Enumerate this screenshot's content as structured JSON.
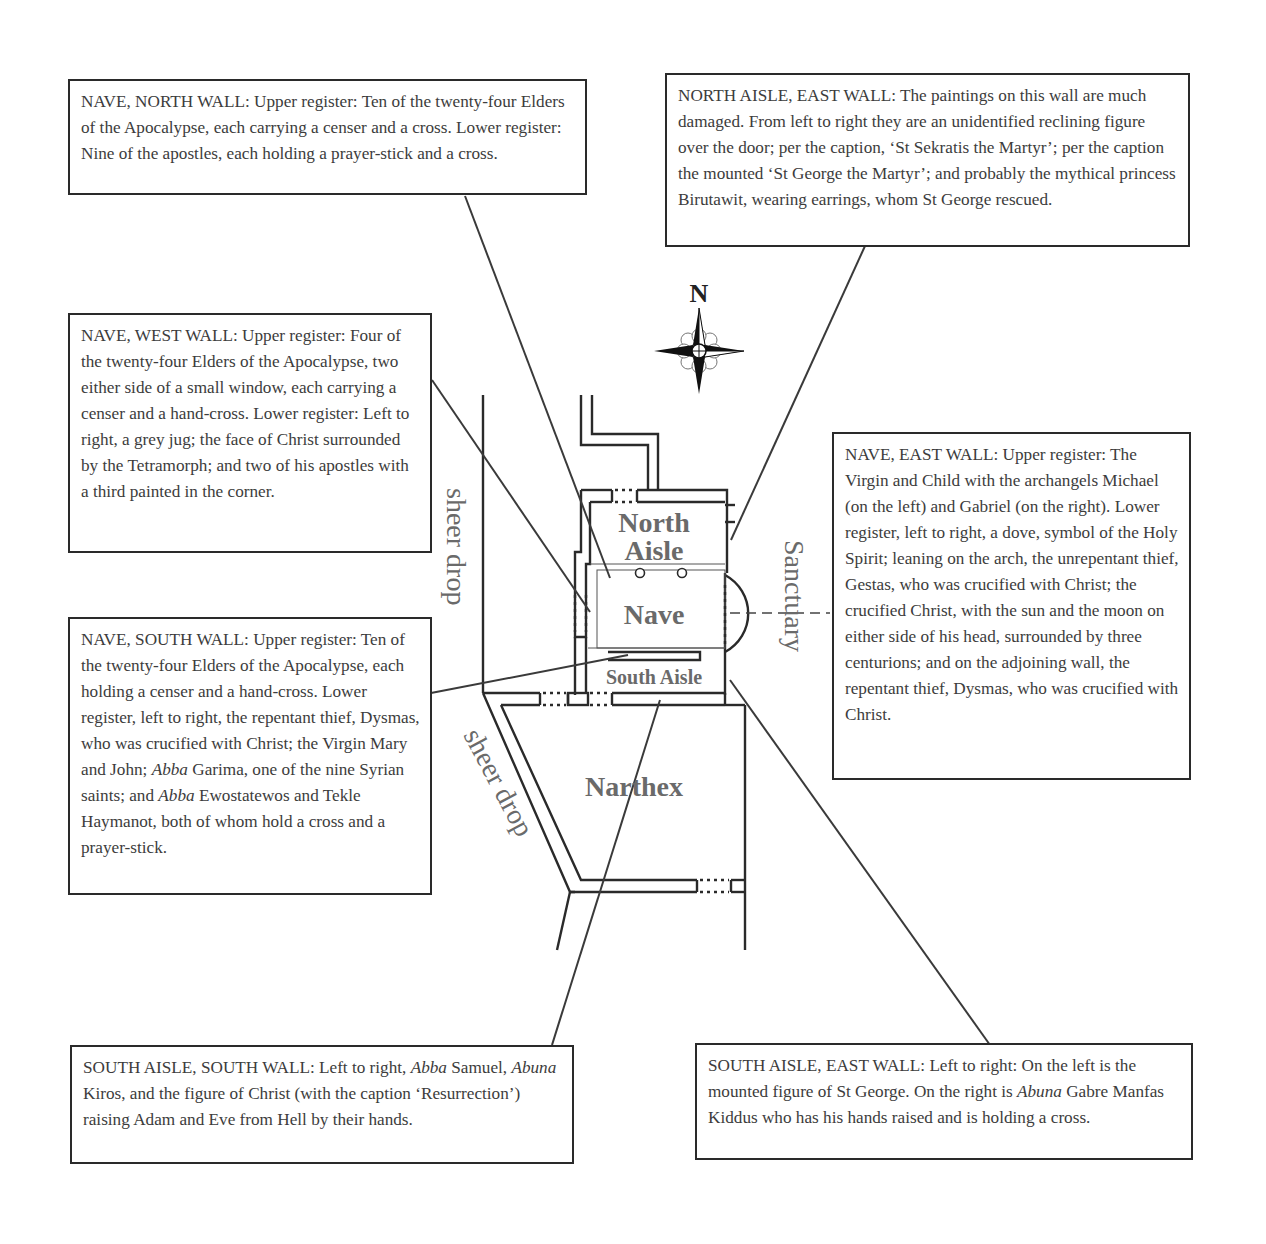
{
  "compass": {
    "label": "N",
    "icon": "compass-rose-icon"
  },
  "rooms": {
    "north_aisle_line1": "North",
    "north_aisle_line2": "Aisle",
    "nave": "Nave",
    "south_aisle": "South Aisle",
    "narthex": "Narthex",
    "sanctuary": "Sanctuary",
    "sheer_drop_1": "sheer drop",
    "sheer_drop_2": "sheer drop"
  },
  "callouts": {
    "nave_north": {
      "heading": "NAVE, NORTH WALL:",
      "text": "Upper register: Ten of the twenty-four Elders of the Apocalypse, each carrying a censer and a cross. Lower register: Nine of the apostles, each holding a prayer-stick and a cross."
    },
    "north_aisle_east": {
      "heading": "NORTH AISLE, EAST WALL:",
      "text": "The paintings on this wall are much damaged. From left to right they are an unidentified reclining figure over the door; per the caption, ‘St Sekratis the Martyr’; per the caption the mounted ‘St George the Martyr’; and probably the mythical princess Birutawit, wearing earrings, whom St George rescued."
    },
    "nave_west": {
      "heading": "NAVE, WEST WALL:",
      "text": "Upper register: Four of the twenty-four Elders of the Apocalypse, two either side of a small window, each carrying a censer and a hand-cross. Lower register: Left to right, a grey jug; the face of Christ surrounded by the Tetramorph; and two of his apostles with a third painted in the corner."
    },
    "nave_east": {
      "heading": "NAVE, EAST WALL:",
      "text": "Upper register: The Virgin and Child with the archangels Michael (on the left) and Gabriel (on the right). Lower register, left to right, a dove, symbol of the Holy Spirit; leaning on the arch, the unrepentant thief, Gestas, who was crucified with Christ; the crucified Christ, with the sun and the moon on either side of his head, surrounded by three centurions; and on the adjoining wall, the repentant thief, Dysmas, who was crucified with Christ."
    },
    "nave_south": {
      "heading": "NAVE, SOUTH WALL:",
      "text_1": "Upper register: Ten of the twenty-four Elders of the Apocalypse, each holding a censer and a hand-cross. Lower register, left to right, the repentant thief, Dysmas, who was crucified with Christ; the Virgin Mary and John; ",
      "italic_1": "Abba",
      "text_2": " Garima, one of the nine Syrian saints; and ",
      "italic_2": "Abba",
      "text_3": " Ewostatewos and Tekle Haymanot, both of whom hold a cross and a prayer-stick."
    },
    "south_aisle_south": {
      "heading": "SOUTH AISLE, SOUTH WALL:",
      "text_1": "Left to right, ",
      "italic_1": "Abba",
      "text_2": " Samuel, ",
      "italic_2": "Abuna",
      "text_3": " Kiros, and the figure of Christ (with the caption ‘Resurrection’) raising Adam and Eve from Hell by their hands."
    },
    "south_aisle_east": {
      "heading": "SOUTH AISLE, EAST WALL:",
      "text_1": "Left to right: On the left is the mounted figure of St George. On the right is ",
      "italic_1": "Abuna",
      "text_2": " Gabre Manfas Kiddus who has his hands raised and is holding a cross."
    }
  },
  "colors": {
    "ink": "#2a2a2a",
    "label": "#6a6a6a",
    "text": "#3c3c3c"
  }
}
